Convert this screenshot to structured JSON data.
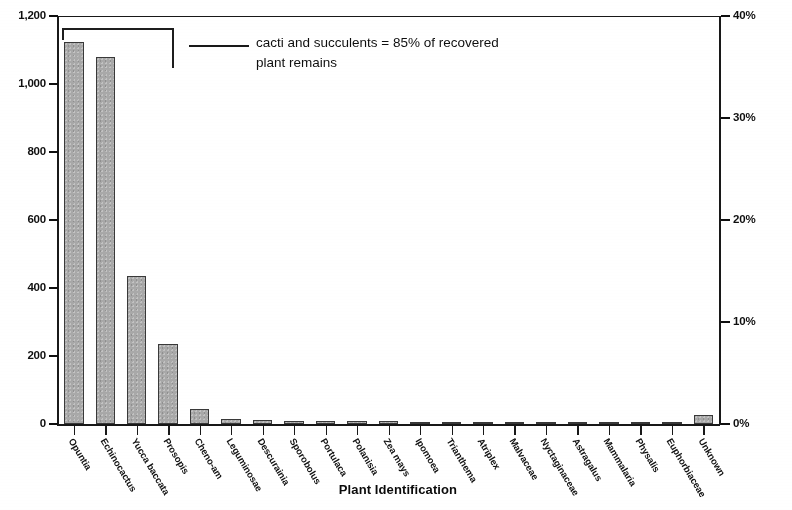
{
  "chart_data": {
    "type": "bar",
    "title": "",
    "xlabel": "Plant Identification",
    "ylabel": "",
    "categories": [
      "Opuntia",
      "Echinocactus",
      "Yucca baccata",
      "Prosopis",
      "Cheno-am",
      "Leguminosae",
      "Descurainia",
      "Sporobolus",
      "Portulaca",
      "Polanisia",
      "Zea mays",
      "Ipomoea",
      "Trianthema",
      "Atriplex",
      "Malvaceae",
      "Nyctaginaceae",
      "Astragalus",
      "Mammalaria",
      "Physalis",
      "Euphorbiaceae",
      "Unknown"
    ],
    "values": [
      1125,
      1080,
      435,
      235,
      45,
      14,
      12,
      10,
      10,
      9,
      8,
      5,
      4,
      4,
      3,
      3,
      3,
      2,
      2,
      2,
      28
    ],
    "ylim": [
      0,
      1200
    ],
    "ytick_labels": [
      "0",
      "200",
      "400",
      "600",
      "800",
      "1,000",
      "1,200"
    ],
    "ytick_values": [
      0,
      200,
      400,
      600,
      800,
      1000,
      1200
    ],
    "y2lim": [
      0,
      40
    ],
    "y2tick_labels": [
      "0%",
      "10%",
      "20%",
      "30%",
      "40%"
    ],
    "y2tick_values": [
      0,
      10,
      20,
      30,
      40
    ],
    "grid": false,
    "legend": "none",
    "annotations": [
      {
        "text": "cacti and succulents = 85% of recovered plant remains",
        "bracket_categories": [
          "Opuntia",
          "Echinocactus",
          "Yucca baccata"
        ]
      }
    ],
    "bar_color": "#a8a8a8",
    "bar_edge_color": "#3a3a3a"
  },
  "axis": {
    "x_title": "Plant Identification"
  },
  "annotation": {
    "line1": "cacti and succulents = 85% of recovered",
    "line2": "plant remains"
  }
}
